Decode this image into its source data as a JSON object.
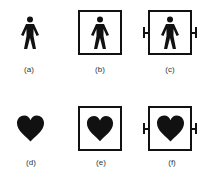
{
  "figure": {
    "panels": [
      {
        "id": "a",
        "label": "(a)",
        "symbol": "person-icon",
        "frame": "none",
        "description": "Type B applied part"
      },
      {
        "id": "b",
        "label": "(b)",
        "symbol": "person-icon",
        "frame": "square",
        "description": "Type BF applied part"
      },
      {
        "id": "c",
        "label": "(c)",
        "symbol": "person-icon",
        "frame": "square-defib",
        "description": "Defibrillation-proof Type BF applied part"
      },
      {
        "id": "d",
        "label": "(d)",
        "symbol": "heart-icon",
        "frame": "none",
        "description": "Type CF applied part"
      },
      {
        "id": "e",
        "label": "(e)",
        "symbol": "heart-icon",
        "frame": "square",
        "description": "Type CF applied part in frame"
      },
      {
        "id": "f",
        "label": "(f)",
        "symbol": "heart-icon",
        "frame": "square-defib",
        "description": "Defibrillation-proof Type CF applied part"
      }
    ],
    "colors": {
      "symbol": "#111111",
      "label": "#333333",
      "background": "#ffffff"
    }
  }
}
